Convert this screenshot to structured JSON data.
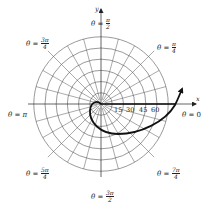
{
  "figure": {
    "type": "polar-graph",
    "center": {
      "x": 101,
      "y": 104
    },
    "grid": {
      "ring_count": 6,
      "ring_spacing_px": 11.2,
      "radial_step_degrees": 15
    },
    "axes": {
      "x_label": "x",
      "y_label": "y"
    },
    "tick_labels": [
      "15",
      "30",
      "45",
      "60"
    ],
    "angle_labels": {
      "theta_0": {
        "prefix": "θ = ",
        "value": "0"
      },
      "theta_pi_4": {
        "prefix": "θ = ",
        "num": "π",
        "den": "4"
      },
      "theta_pi_2": {
        "prefix": "θ = ",
        "num": "π",
        "den": "2"
      },
      "theta_3pi_4": {
        "prefix": "θ = ",
        "num": "3π",
        "den": "4"
      },
      "theta_pi": {
        "prefix": "θ = ",
        "value": "π"
      },
      "theta_5pi_4": {
        "prefix": "θ = ",
        "num": "5π",
        "den": "4"
      },
      "theta_3pi_2": {
        "prefix": "θ = ",
        "num": "3π",
        "den": "2"
      },
      "theta_7pi_4": {
        "prefix": "θ = ",
        "num": "7π",
        "den": "4"
      }
    },
    "curve": {
      "description": "spiral traced clockwise from origin with arrowhead",
      "stroke_color": "#111111"
    },
    "colors": {
      "grid": "#555555",
      "curve": "#111111",
      "text": "#222222"
    }
  }
}
